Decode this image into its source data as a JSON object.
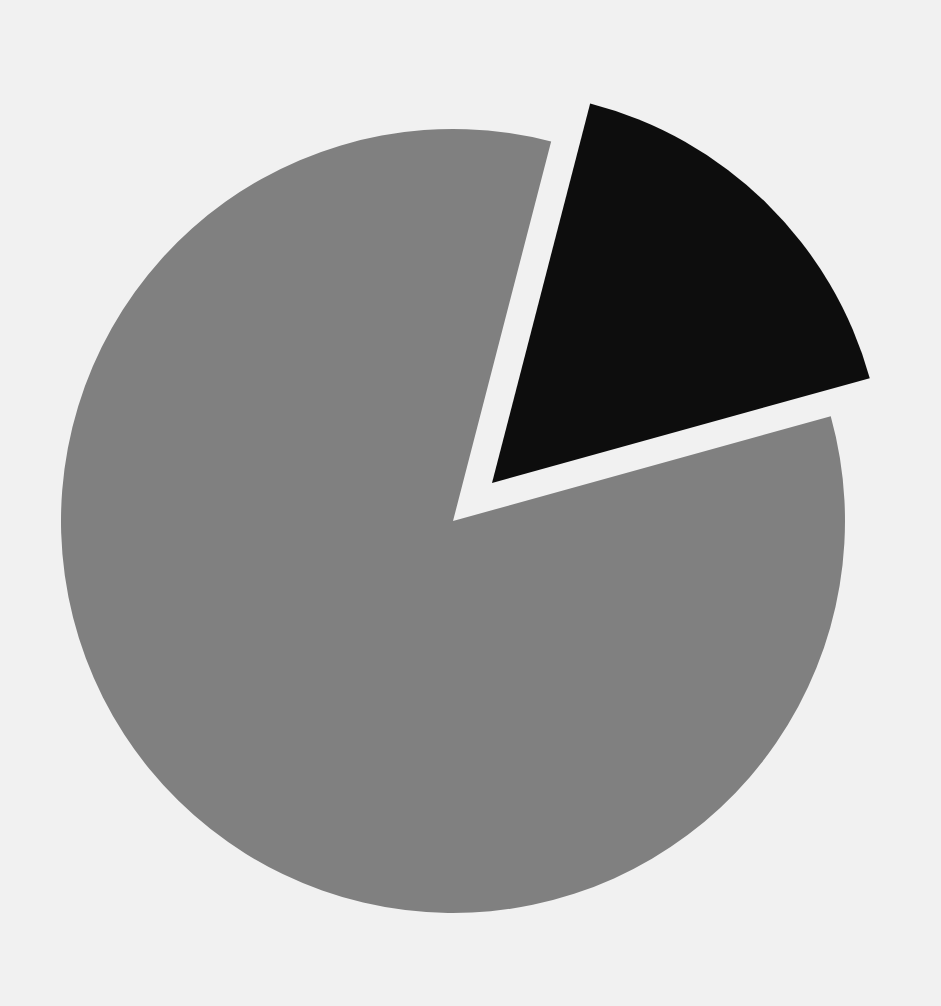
{
  "figure": {
    "title": "",
    "background_color": "#f1f1f1",
    "width": 941,
    "height": 1006
  },
  "chart_data": {
    "type": "pie",
    "title": "",
    "subtitle": "",
    "xlabel": "",
    "ylabel": "",
    "grid": false,
    "legend": false,
    "legend_position": "none",
    "labels": [
      "Slice 1",
      "Slice 2"
    ],
    "values": [
      83,
      17
    ],
    "percentages": [
      "83%",
      "17%"
    ],
    "colors": [
      "#808080",
      "#0d0d0d"
    ],
    "start_angle": 104,
    "counterclockwise": false,
    "explode": [
      0,
      0.14
    ],
    "slices": [
      {
        "name": "Slice 1",
        "value": 83,
        "percent": "83%",
        "color": "#808080",
        "start_angle_deg": -15.5,
        "end_angle_deg": 284.5,
        "sweep_deg": 300,
        "exploded": false,
        "offset_px": 0,
        "center_x": 453,
        "center_y": 521,
        "radius": 392
      },
      {
        "name": "Slice 2",
        "value": 17,
        "percent": "17%",
        "color": "#0d0d0d",
        "start_angle_deg": -75.5,
        "end_angle_deg": -15.5,
        "sweep_deg": 60,
        "exploded": true,
        "offset_px": 55,
        "center_x": 492,
        "center_y": 483,
        "radius": 392
      }
    ],
    "annotations": [],
    "tick_labels": [],
    "data_labels": []
  }
}
